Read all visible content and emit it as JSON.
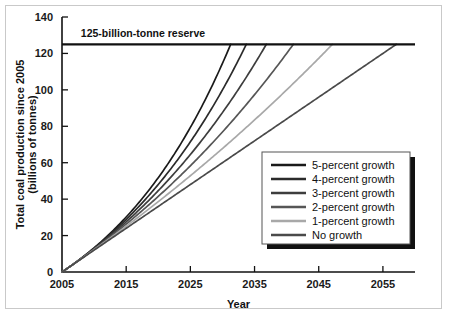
{
  "chart_data": {
    "type": "line",
    "title": "",
    "xlabel": "Year",
    "ylabel": "Total coal production since 2005 (billions of tonnes)",
    "ylabel_line1": "Total coal production since 2005",
    "ylabel_line2": "(billions of tonnes)",
    "xlim": [
      2005,
      2060
    ],
    "ylim": [
      0,
      140
    ],
    "xticks": [
      2005,
      2015,
      2025,
      2035,
      2045,
      2055
    ],
    "xtick_labels": [
      "2005",
      "2015",
      "2025",
      "2035",
      "2045",
      "2055"
    ],
    "yticks": [
      0,
      20,
      40,
      60,
      80,
      100,
      120,
      140
    ],
    "ytick_labels": [
      "0",
      "20",
      "40",
      "60",
      "80",
      "100",
      "120",
      "140"
    ],
    "grid": false,
    "legend_position": "lower-right",
    "annotations": [
      {
        "text": "125-billion-tonne reserve",
        "x": 2007,
        "y": 125,
        "line_value": 125,
        "color": "#111111"
      }
    ],
    "series": [
      {
        "name": "5-percent growth",
        "growth_rate": 0.05,
        "color": "#1a1a1a",
        "reaches_reserve_year": 2032,
        "x": [
          2005,
          2010,
          2015,
          2020,
          2025,
          2030,
          2032
        ],
        "values": [
          0,
          11.6,
          26.5,
          45.4,
          69.6,
          100.4,
          115.3
        ]
      },
      {
        "name": "4-percent growth",
        "growth_rate": 0.04,
        "color": "#2b2b2b",
        "reaches_reserve_year": 2034,
        "x": [
          2005,
          2010,
          2015,
          2020,
          2025,
          2030,
          2034
        ],
        "values": [
          0,
          11.3,
          25.0,
          41.7,
          62.0,
          86.8,
          112.0
        ]
      },
      {
        "name": "3-percent growth",
        "growth_rate": 0.03,
        "color": "#3d3d3d",
        "reaches_reserve_year": 2036,
        "x": [
          2005,
          2010,
          2015,
          2020,
          2025,
          2030,
          2036
        ],
        "values": [
          0,
          10.9,
          23.6,
          38.3,
          55.4,
          75.2,
          104.0
        ]
      },
      {
        "name": "2-percent growth",
        "growth_rate": 0.02,
        "color": "#565656",
        "reaches_reserve_year": 2040,
        "x": [
          2005,
          2010,
          2015,
          2020,
          2025,
          2030,
          2040
        ],
        "values": [
          0,
          10.6,
          22.3,
          35.3,
          49.6,
          65.4,
          102.0
        ]
      },
      {
        "name": "1-percent growth",
        "growth_rate": 0.01,
        "color": "#a8a8a8",
        "reaches_reserve_year": 2046,
        "x": [
          2005,
          2010,
          2015,
          2020,
          2025,
          2030,
          2046
        ],
        "values": [
          0,
          10.3,
          21.1,
          32.5,
          44.4,
          56.9,
          99.8
        ]
      },
      {
        "name": "No growth",
        "growth_rate": 0.0,
        "color": "#4a4a4a",
        "reaches_reserve_year": 2057,
        "x": [
          2005,
          2015,
          2025,
          2035,
          2045,
          2057
        ],
        "values": [
          0,
          24.0,
          48.0,
          72.0,
          96.0,
          124.8
        ]
      }
    ],
    "legend_entries": [
      {
        "label": "5-percent growth",
        "color": "#1a1a1a"
      },
      {
        "label": "4-percent growth",
        "color": "#2b2b2b"
      },
      {
        "label": "3-percent growth",
        "color": "#3d3d3d"
      },
      {
        "label": "2-percent growth",
        "color": "#565656"
      },
      {
        "label": "1-percent growth",
        "color": "#a8a8a8"
      },
      {
        "label": "No growth",
        "color": "#4a4a4a"
      }
    ]
  }
}
